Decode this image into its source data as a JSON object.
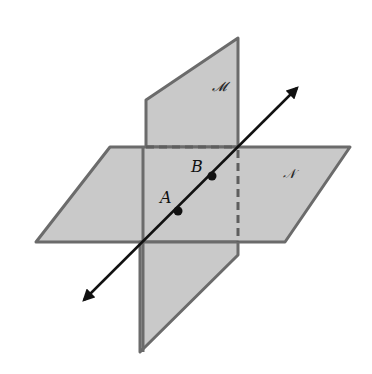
{
  "diagram": {
    "planes": [
      {
        "name": "M",
        "label": "𝓜",
        "orientation": "vertical"
      },
      {
        "name": "N",
        "label": "𝒩",
        "orientation": "horizontal"
      }
    ],
    "points": [
      {
        "name": "A",
        "label": "A"
      },
      {
        "name": "B",
        "label": "B"
      }
    ],
    "line": {
      "label": "",
      "arrows": "both"
    },
    "colors": {
      "plane_fill": "#c9c9c9",
      "plane_edge": "#6b6b6b",
      "line": "#111111",
      "background": "#ffffff"
    }
  }
}
